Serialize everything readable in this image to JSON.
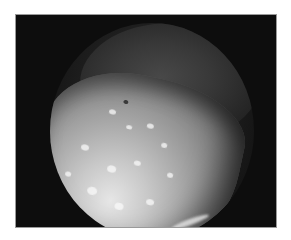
{
  "image": {
    "kind": "grayscale endoscopic photograph",
    "description": "Circular endoscopic field of view on black background showing a bright, nodular tissue surface in the lower portion with a dimmer mucosal fold above",
    "colors": {
      "page_background": "#ffffff",
      "frame_background": "#0d0d0d",
      "tissue_highlight": "#e6e6e6",
      "tissue_mid": "#a0a0a0",
      "fold": "#3a3a3a"
    }
  }
}
